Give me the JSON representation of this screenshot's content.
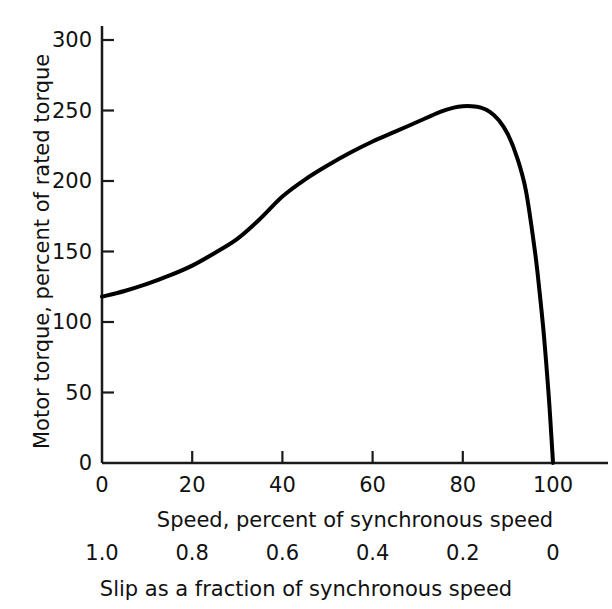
{
  "chart_data": {
    "type": "line",
    "title": "",
    "subtitle": "",
    "xlabel": "Speed, percent of synchronous speed",
    "ylabel": "Motor torque, percent of rated torque",
    "secondary_xlabel": "Slip as a fraction of synchronous speed",
    "xlim": [
      0,
      100
    ],
    "ylim": [
      0,
      300
    ],
    "grid": false,
    "legend": null,
    "x_ticks": [
      0,
      20,
      40,
      60,
      80,
      100
    ],
    "x_tick_labels": [
      "0",
      "20",
      "40",
      "60",
      "80",
      "100"
    ],
    "y_ticks": [
      0,
      50,
      100,
      150,
      200,
      250,
      300
    ],
    "y_tick_labels": [
      "0",
      "50",
      "100",
      "150",
      "200",
      "250",
      "300"
    ],
    "secondary_x_ticks": [
      0,
      20,
      40,
      60,
      80,
      100
    ],
    "secondary_x_tick_labels": [
      "1.0",
      "0.8",
      "0.6",
      "0.4",
      "0.2",
      "0"
    ],
    "series": [
      {
        "name": "Motor torque-speed characteristic",
        "color": "#000000",
        "line_width": 4,
        "x": [
          0,
          5,
          10,
          15,
          20,
          25,
          30,
          35,
          40,
          45,
          50,
          55,
          60,
          65,
          70,
          75,
          78,
          80,
          82,
          84,
          86,
          88,
          90,
          92,
          94,
          96,
          97,
          98,
          99,
          99.5,
          100
        ],
        "y": [
          118,
          122,
          127,
          133,
          140,
          149,
          159,
          173,
          189,
          201,
          211,
          220,
          228,
          235,
          242,
          249,
          252,
          253,
          253,
          252,
          249,
          243,
          233,
          217,
          193,
          150,
          122,
          90,
          50,
          26,
          0
        ]
      }
    ],
    "axis_color": "#1a1a1a",
    "background": "#ffffff"
  },
  "layout": {
    "plot_left_px": 102,
    "plot_right_px": 553,
    "plot_bottom_px": 463,
    "plot_top_px": 40,
    "axis_overrun_right_px": 608,
    "axis_overrun_top_px": 26
  }
}
